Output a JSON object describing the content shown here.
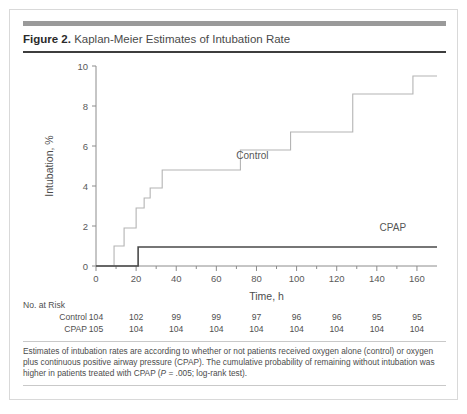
{
  "figure": {
    "number_label": "Figure 2.",
    "title": "Kaplan-Meier Estimates of Intubation Rate"
  },
  "risk_table": {
    "heading": "No. at Risk",
    "rows": [
      {
        "label": "Control",
        "values": [
          "104",
          "102",
          "99",
          "99",
          "97",
          "96",
          "96",
          "95",
          "95"
        ]
      },
      {
        "label": "CPAP",
        "values": [
          "105",
          "104",
          "104",
          "104",
          "104",
          "104",
          "104",
          "104",
          "104"
        ]
      }
    ]
  },
  "footnote": {
    "line1": "Estimates of intubation rates are according to whether or not patients received oxygen alone (control) or oxygen plus",
    "line2": "continuous positive airway pressure (CPAP). The cumulative probability of remaining without intubation was higher in",
    "line3_pre": "patients treated with CPAP (",
    "line3_italic": "P",
    "line3_post": " = .005; log-rank test)."
  },
  "colors": {
    "control_line": "#b4b4b4",
    "cpap_line": "#4a4a4a",
    "axis": "#8c8c8c",
    "header_bar": "#9a9a9a",
    "title_rule": "#3d3d3d",
    "text": "#4c4c4c"
  },
  "chart_data": {
    "type": "line",
    "subtype": "kaplan-meier-step",
    "title": "Kaplan-Meier Estimates of Intubation Rate",
    "xlabel": "Time, h",
    "ylabel": "Intubation, %",
    "xlim": [
      0,
      170
    ],
    "ylim": [
      0,
      10
    ],
    "xticks": [
      0,
      20,
      40,
      60,
      80,
      100,
      120,
      140,
      160
    ],
    "xtick_labels": [
      "0",
      "20",
      "40",
      "60",
      "80",
      "100",
      "120",
      "140",
      "160"
    ],
    "xminor_step": 10,
    "yticks": [
      0,
      2,
      4,
      6,
      8,
      10
    ],
    "ytick_labels": [
      "0",
      "2",
      "4",
      "6",
      "8",
      "10"
    ],
    "grid": false,
    "legend": "inline-labels",
    "annotations": [
      {
        "text": "Control",
        "x": 78,
        "y": 5.35
      },
      {
        "text": "CPAP",
        "x": 148,
        "y": 1.75
      }
    ],
    "series": [
      {
        "name": "Control",
        "color": "#b4b4b4",
        "risk_at_times": [
          104,
          102,
          99,
          99,
          97,
          96,
          96,
          95,
          95
        ],
        "step_points": [
          [
            0,
            0
          ],
          [
            9,
            0
          ],
          [
            9,
            1.0
          ],
          [
            14,
            1.0
          ],
          [
            14,
            1.9
          ],
          [
            20,
            1.9
          ],
          [
            20,
            2.9
          ],
          [
            24,
            2.9
          ],
          [
            24,
            3.4
          ],
          [
            27,
            3.4
          ],
          [
            27,
            3.9
          ],
          [
            33,
            3.9
          ],
          [
            33,
            4.8
          ],
          [
            72,
            4.8
          ],
          [
            72,
            5.8
          ],
          [
            97,
            5.8
          ],
          [
            97,
            6.7
          ],
          [
            128,
            6.7
          ],
          [
            128,
            8.6
          ],
          [
            158,
            8.6
          ],
          [
            158,
            9.5
          ],
          [
            170,
            9.5
          ]
        ]
      },
      {
        "name": "CPAP",
        "color": "#4a4a4a",
        "risk_at_times": [
          105,
          104,
          104,
          104,
          104,
          104,
          104,
          104,
          104
        ],
        "step_points": [
          [
            0,
            0
          ],
          [
            21,
            0
          ],
          [
            21,
            0.95
          ],
          [
            170,
            0.95
          ]
        ]
      }
    ]
  }
}
